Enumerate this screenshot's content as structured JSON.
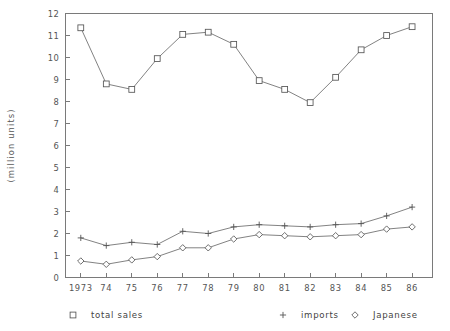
{
  "chart_data": {
    "type": "line",
    "title": "",
    "subtitle": "",
    "xlabel": "",
    "ylabel": "(million units)",
    "categories": [
      "1973",
      "74",
      "75",
      "76",
      "77",
      "78",
      "79",
      "80",
      "81",
      "82",
      "83",
      "84",
      "85",
      "86"
    ],
    "x": [
      1973,
      1974,
      1975,
      1976,
      1977,
      1978,
      1979,
      1980,
      1981,
      1982,
      1983,
      1984,
      1985,
      1986
    ],
    "xlim": [
      1972.4,
      1986.8
    ],
    "ylim": [
      0,
      12
    ],
    "yticks": [
      0,
      1,
      2,
      3,
      4,
      5,
      6,
      7,
      8,
      9,
      10,
      11,
      12
    ],
    "ytick_labels": [
      "0",
      "1",
      "2",
      "3",
      "4",
      "5",
      "6",
      "7",
      "8",
      "9",
      "10",
      "11",
      "12"
    ],
    "grid": false,
    "legend_position": "below",
    "series": [
      {
        "name": "total sales",
        "marker": "square",
        "values": [
          11.35,
          8.8,
          8.55,
          9.95,
          11.05,
          11.15,
          10.6,
          8.95,
          8.55,
          7.95,
          9.1,
          10.35,
          11.0,
          11.4
        ]
      },
      {
        "name": "imports",
        "marker": "plus",
        "values": [
          1.8,
          1.45,
          1.6,
          1.5,
          2.1,
          2.0,
          2.3,
          2.4,
          2.35,
          2.3,
          2.4,
          2.45,
          2.8,
          3.2
        ]
      },
      {
        "name": "Japanese",
        "marker": "diamond",
        "values": [
          0.75,
          0.6,
          0.8,
          0.95,
          1.35,
          1.35,
          1.75,
          1.95,
          1.9,
          1.85,
          1.9,
          1.95,
          2.2,
          2.3
        ]
      }
    ]
  },
  "legend": {
    "items": [
      {
        "label": "total sales",
        "marker": "square"
      },
      {
        "label": "imports",
        "marker": "plus"
      },
      {
        "label": "Japanese",
        "marker": "diamond"
      }
    ]
  },
  "colors": {
    "axis": "#7a7a7a",
    "text": "#555555",
    "line": "#6b6b6b",
    "marker_fill": "#ffffff",
    "background": "#ffffff"
  }
}
